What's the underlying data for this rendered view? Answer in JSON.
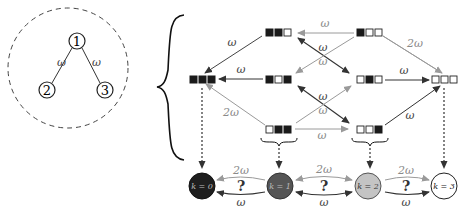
{
  "tree": {
    "nodes": [
      {
        "id": "1",
        "label": "1"
      },
      {
        "id": "2",
        "label": "2"
      },
      {
        "id": "3",
        "label": "3"
      }
    ],
    "edges": [
      {
        "from": "1",
        "to": "2",
        "label": "ω"
      },
      {
        "from": "1",
        "to": "3",
        "label": "ω"
      }
    ]
  },
  "states": [
    {
      "id": "s110",
      "pattern": "■■□"
    },
    {
      "id": "s100",
      "pattern": "■□□"
    },
    {
      "id": "s111",
      "pattern": "■■■"
    },
    {
      "id": "s101",
      "pattern": "■□■"
    },
    {
      "id": "s010",
      "pattern": "□■□"
    },
    {
      "id": "s000",
      "pattern": "□□□"
    },
    {
      "id": "s011",
      "pattern": "□■■"
    },
    {
      "id": "s001",
      "pattern": "□□■"
    }
  ],
  "transitions": [
    {
      "from": "s100",
      "to": "s110",
      "label": "ω"
    },
    {
      "from": "s100",
      "to": "s000",
      "label": "2ω"
    },
    {
      "from": "s110",
      "to": "s111",
      "label": "ω"
    },
    {
      "from": "s101",
      "to": "s111",
      "label": "ω"
    },
    {
      "from": "s011",
      "to": "s111",
      "label": "2ω"
    },
    {
      "from": "s010",
      "to": "s000",
      "label": "ω"
    },
    {
      "from": "s001",
      "to": "s000",
      "label": "ω"
    },
    {
      "from": "s011",
      "to": "s001",
      "label": "ω"
    },
    {
      "from": "s110",
      "to": "s010",
      "label": "ω"
    },
    {
      "from": "s100",
      "to": "s101",
      "label": "ω"
    },
    {
      "from": "s101",
      "to": "s001",
      "label": "ω"
    },
    {
      "from": "s011",
      "to": "s010",
      "label": "ω"
    }
  ],
  "k_states": [
    {
      "label": "k = 0",
      "fill": "#1e1e1e"
    },
    {
      "label": "k = 1",
      "fill": "#555555"
    },
    {
      "label": "k = 2",
      "fill": "#c4c4c4"
    },
    {
      "label": "k = 3",
      "fill": "#ffffff"
    }
  ],
  "k_transitions": [
    {
      "from": "k = 1",
      "to": "k = 0",
      "top_label": "2ω",
      "middle_label": "?",
      "bottom_label": "ω"
    },
    {
      "from": "k = 1",
      "to": "k = 2",
      "top_label": "2ω",
      "middle_label": "?",
      "bottom_label": "ω"
    },
    {
      "from": "k = 2",
      "to": "k = 3",
      "top_label": "2ω",
      "middle_label": "?",
      "bottom_label": "ω"
    }
  ],
  "labels": {
    "omega": "ω",
    "two_omega": "2ω",
    "question": "?",
    "node1": "1",
    "node2": "2",
    "node3": "3",
    "k0": "k = 0",
    "k1": "k = 1",
    "k2": "k = 2",
    "k3": "k = 3"
  },
  "colors": {
    "dark_arrow": "#333333",
    "light_arrow": "#9a9a9a",
    "label_gray": "#8a8a8a",
    "k0": "#1e1e1e",
    "k1": "#555555",
    "k2": "#c4c4c4",
    "k3": "#ffffff"
  }
}
